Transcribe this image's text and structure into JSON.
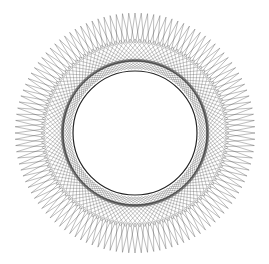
{
  "figure": {
    "center": [
      135,
      133
    ],
    "outer_radius": 120,
    "mid_radius": 90,
    "inner_radius": 62,
    "spike_count": 120,
    "chord_skip": 23,
    "colors": {
      "background": "#ffffff",
      "line": "#3a3a3a",
      "inner_edge": "#222222"
    }
  }
}
